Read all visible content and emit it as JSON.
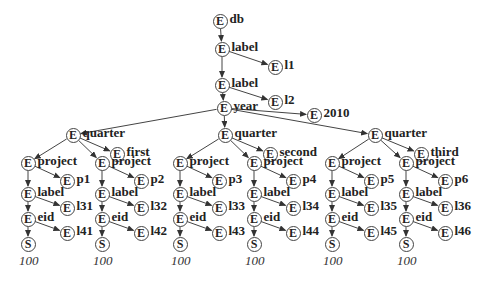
{
  "diagram": {
    "type": "xml-tree",
    "node_types": {
      "element": "E",
      "string": "S"
    },
    "root": {
      "id": "n0",
      "label": "db"
    },
    "nodes": [
      {
        "id": "n0",
        "type": "E",
        "label": "db",
        "x": 220,
        "y": 21
      },
      {
        "id": "n1",
        "type": "E",
        "label": "label",
        "x": 222,
        "y": 49
      },
      {
        "id": "n2",
        "type": "E",
        "label": "l1",
        "x": 275,
        "y": 67
      },
      {
        "id": "n3",
        "type": "E",
        "label": "label",
        "x": 222,
        "y": 85
      },
      {
        "id": "n4",
        "type": "E",
        "label": "l2",
        "x": 275,
        "y": 102
      },
      {
        "id": "n5",
        "type": "E",
        "label": "year",
        "x": 224,
        "y": 108
      },
      {
        "id": "n6",
        "type": "E",
        "label": "2010",
        "x": 314,
        "y": 115
      },
      {
        "id": "q1",
        "type": "E",
        "label": "quarter",
        "x": 73,
        "y": 135
      },
      {
        "id": "q1n",
        "type": "E",
        "label": "first",
        "x": 117,
        "y": 154
      },
      {
        "id": "q2",
        "type": "E",
        "label": "quarter",
        "x": 225,
        "y": 135
      },
      {
        "id": "q2n",
        "type": "E",
        "label": "second",
        "x": 270,
        "y": 154
      },
      {
        "id": "q3",
        "type": "E",
        "label": "quarter",
        "x": 375,
        "y": 135
      },
      {
        "id": "q3n",
        "type": "E",
        "label": "third",
        "x": 421,
        "y": 154
      },
      {
        "id": "p1",
        "type": "E",
        "label": "project",
        "x": 28,
        "y": 163
      },
      {
        "id": "p1n",
        "type": "E",
        "label": "p1",
        "x": 67,
        "y": 181
      },
      {
        "id": "p1l",
        "type": "E",
        "label": "label",
        "x": 28,
        "y": 194
      },
      {
        "id": "p1ln",
        "type": "E",
        "label": "l31",
        "x": 67,
        "y": 208
      },
      {
        "id": "p1e",
        "type": "E",
        "label": "eid",
        "x": 28,
        "y": 219
      },
      {
        "id": "p1en",
        "type": "E",
        "label": "l41",
        "x": 67,
        "y": 233
      },
      {
        "id": "p1s",
        "type": "S",
        "label": "",
        "x": 28,
        "y": 244
      },
      {
        "id": "p2",
        "type": "E",
        "label": "project",
        "x": 102,
        "y": 163
      },
      {
        "id": "p2n",
        "type": "E",
        "label": "p2",
        "x": 141,
        "y": 181
      },
      {
        "id": "p2l",
        "type": "E",
        "label": "label",
        "x": 102,
        "y": 194
      },
      {
        "id": "p2ln",
        "type": "E",
        "label": "l32",
        "x": 141,
        "y": 208
      },
      {
        "id": "p2e",
        "type": "E",
        "label": "eid",
        "x": 102,
        "y": 219
      },
      {
        "id": "p2en",
        "type": "E",
        "label": "l42",
        "x": 141,
        "y": 233
      },
      {
        "id": "p2s",
        "type": "S",
        "label": "",
        "x": 102,
        "y": 244
      },
      {
        "id": "p3",
        "type": "E",
        "label": "project",
        "x": 180,
        "y": 163
      },
      {
        "id": "p3n",
        "type": "E",
        "label": "p3",
        "x": 219,
        "y": 181
      },
      {
        "id": "p3l",
        "type": "E",
        "label": "label",
        "x": 180,
        "y": 194
      },
      {
        "id": "p3ln",
        "type": "E",
        "label": "l33",
        "x": 219,
        "y": 208
      },
      {
        "id": "p3e",
        "type": "E",
        "label": "eid",
        "x": 180,
        "y": 219
      },
      {
        "id": "p3en",
        "type": "E",
        "label": "l43",
        "x": 219,
        "y": 233
      },
      {
        "id": "p3s",
        "type": "S",
        "label": "",
        "x": 180,
        "y": 244
      },
      {
        "id": "p4",
        "type": "E",
        "label": "project",
        "x": 254,
        "y": 163
      },
      {
        "id": "p4n",
        "type": "E",
        "label": "p4",
        "x": 293,
        "y": 181
      },
      {
        "id": "p4l",
        "type": "E",
        "label": "label",
        "x": 254,
        "y": 194
      },
      {
        "id": "p4ln",
        "type": "E",
        "label": "l34",
        "x": 293,
        "y": 208
      },
      {
        "id": "p4e",
        "type": "E",
        "label": "eid",
        "x": 254,
        "y": 219
      },
      {
        "id": "p4en",
        "type": "E",
        "label": "l44",
        "x": 293,
        "y": 233
      },
      {
        "id": "p4s",
        "type": "S",
        "label": "",
        "x": 254,
        "y": 244
      },
      {
        "id": "p5",
        "type": "E",
        "label": "project",
        "x": 332,
        "y": 163
      },
      {
        "id": "p5n",
        "type": "E",
        "label": "p5",
        "x": 371,
        "y": 181
      },
      {
        "id": "p5l",
        "type": "E",
        "label": "label",
        "x": 332,
        "y": 194
      },
      {
        "id": "p5ln",
        "type": "E",
        "label": "l35",
        "x": 371,
        "y": 208
      },
      {
        "id": "p5e",
        "type": "E",
        "label": "eid",
        "x": 332,
        "y": 219
      },
      {
        "id": "p5en",
        "type": "E",
        "label": "l45",
        "x": 371,
        "y": 233
      },
      {
        "id": "p5s",
        "type": "S",
        "label": "",
        "x": 332,
        "y": 244
      },
      {
        "id": "p6",
        "type": "E",
        "label": "project",
        "x": 406,
        "y": 163
      },
      {
        "id": "p6n",
        "type": "E",
        "label": "p6",
        "x": 445,
        "y": 181
      },
      {
        "id": "p6l",
        "type": "E",
        "label": "label",
        "x": 406,
        "y": 194
      },
      {
        "id": "p6ln",
        "type": "E",
        "label": "l36",
        "x": 445,
        "y": 208
      },
      {
        "id": "p6e",
        "type": "E",
        "label": "eid",
        "x": 406,
        "y": 219
      },
      {
        "id": "p6en",
        "type": "E",
        "label": "l46",
        "x": 445,
        "y": 233
      },
      {
        "id": "p6s",
        "type": "S",
        "label": "",
        "x": 406,
        "y": 244
      }
    ],
    "edges": [
      [
        "n0",
        "n1"
      ],
      [
        "n1",
        "n2"
      ],
      [
        "n1",
        "n3"
      ],
      [
        "n3",
        "n4"
      ],
      [
        "n3",
        "n5"
      ],
      [
        "n5",
        "n6"
      ],
      [
        "n5",
        "q1"
      ],
      [
        "n5",
        "q2"
      ],
      [
        "n5",
        "q3"
      ],
      [
        "q1",
        "q1n"
      ],
      [
        "q1",
        "p1"
      ],
      [
        "q1",
        "p2"
      ],
      [
        "q2",
        "q2n"
      ],
      [
        "q2",
        "p3"
      ],
      [
        "q2",
        "p4"
      ],
      [
        "q3",
        "q3n"
      ],
      [
        "q3",
        "p5"
      ],
      [
        "q3",
        "p6"
      ],
      [
        "p1",
        "p1n"
      ],
      [
        "p1",
        "p1l"
      ],
      [
        "p1l",
        "p1ln"
      ],
      [
        "p1l",
        "p1e"
      ],
      [
        "p1e",
        "p1en"
      ],
      [
        "p1e",
        "p1s"
      ],
      [
        "p2",
        "p2n"
      ],
      [
        "p2",
        "p2l"
      ],
      [
        "p2l",
        "p2ln"
      ],
      [
        "p2l",
        "p2e"
      ],
      [
        "p2e",
        "p2en"
      ],
      [
        "p2e",
        "p2s"
      ],
      [
        "p3",
        "p3n"
      ],
      [
        "p3",
        "p3l"
      ],
      [
        "p3l",
        "p3ln"
      ],
      [
        "p3l",
        "p3e"
      ],
      [
        "p3e",
        "p3en"
      ],
      [
        "p3e",
        "p3s"
      ],
      [
        "p4",
        "p4n"
      ],
      [
        "p4",
        "p4l"
      ],
      [
        "p4l",
        "p4ln"
      ],
      [
        "p4l",
        "p4e"
      ],
      [
        "p4e",
        "p4en"
      ],
      [
        "p4e",
        "p4s"
      ],
      [
        "p5",
        "p5n"
      ],
      [
        "p5",
        "p5l"
      ],
      [
        "p5l",
        "p5ln"
      ],
      [
        "p5l",
        "p5e"
      ],
      [
        "p5e",
        "p5en"
      ],
      [
        "p5e",
        "p5s"
      ],
      [
        "p6",
        "p6n"
      ],
      [
        "p6",
        "p6l"
      ],
      [
        "p6l",
        "p6ln"
      ],
      [
        "p6l",
        "p6e"
      ],
      [
        "p6e",
        "p6en"
      ],
      [
        "p6e",
        "p6s"
      ]
    ],
    "string_values": [
      {
        "node": "p1s",
        "value": "100"
      },
      {
        "node": "p2s",
        "value": "100"
      },
      {
        "node": "p3s",
        "value": "100"
      },
      {
        "node": "p4s",
        "value": "100"
      },
      {
        "node": "p5s",
        "value": "100"
      },
      {
        "node": "p6s",
        "value": "100"
      }
    ],
    "colors": {
      "stroke": "#444444",
      "text": "#222222",
      "background": "#ffffff"
    }
  }
}
